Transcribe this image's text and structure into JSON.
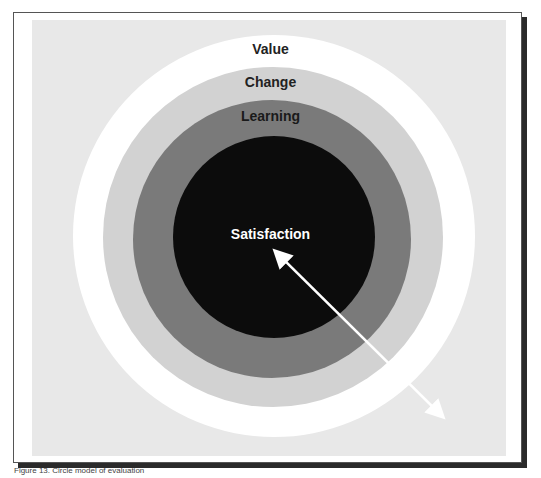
{
  "diagram": {
    "type": "concentric-circles",
    "layers": [
      {
        "label": "Value",
        "color": "#ffffff",
        "text_color": "#222222"
      },
      {
        "label": "Change",
        "color": "#d2d2d2",
        "text_color": "#222222"
      },
      {
        "label": "Learning",
        "color": "#7a7a7a",
        "text_color": "#1a1a1a"
      },
      {
        "label": "Satisfaction",
        "color": "#0c0c0c",
        "text_color": "#ffffff"
      }
    ],
    "arrow": {
      "direction": "bidirectional",
      "color": "#ffffff"
    }
  },
  "caption": "Figure 13. Circle model of evaluation"
}
